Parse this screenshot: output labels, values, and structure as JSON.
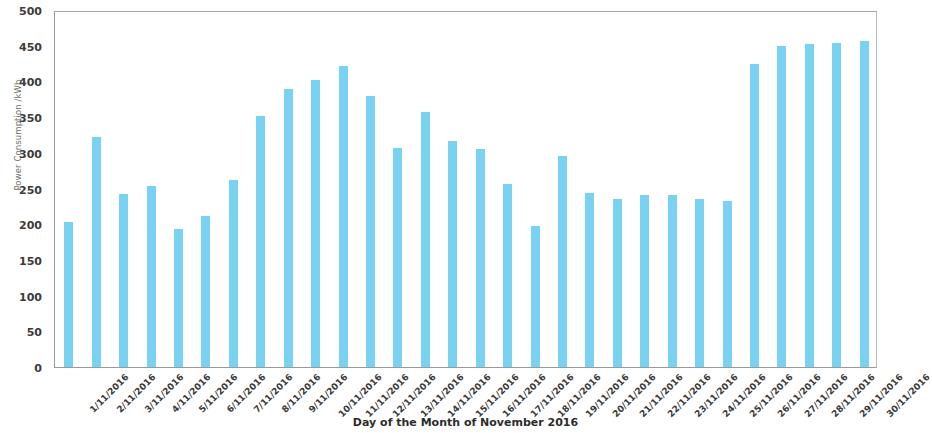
{
  "chart_data": {
    "type": "bar",
    "title": "",
    "xlabel": "Day of the Month of November 2016",
    "ylabel": "Power Consumption /kWh",
    "ylim": [
      0,
      500
    ],
    "ytick_step": 50,
    "yticks": [
      0,
      50,
      100,
      150,
      200,
      250,
      300,
      350,
      400,
      450,
      500
    ],
    "grid": false,
    "legend": "none",
    "bar_color": "#79d2f2",
    "frame_color": "#9a9a9a",
    "categories": [
      "1/11/2016",
      "2/11/2016",
      "3/11/2016",
      "4/11/2016",
      "5/11/2016",
      "6/11/2016",
      "7/11/2016",
      "8/11/2016",
      "9/11/2016",
      "10/11/2016",
      "11/11/2016",
      "12/11/2016",
      "13/11/2016",
      "14/11/2016",
      "15/11/2016",
      "16/11/2016",
      "17/11/2016",
      "18/11/2016",
      "19/11/2016",
      "20/11/2016",
      "21/11/2016",
      "22/11/2016",
      "23/11/2016",
      "24/11/2016",
      "25/11/2016",
      "26/11/2016",
      "27/11/2016",
      "28/11/2016",
      "29/11/2016",
      "30/11/2016"
    ],
    "values": [
      203,
      322,
      243,
      254,
      193,
      211,
      262,
      352,
      389,
      402,
      421,
      380,
      307,
      357,
      317,
      305,
      257,
      197,
      295,
      244,
      236,
      241,
      241,
      236,
      232,
      425,
      450,
      453,
      454,
      456
    ]
  }
}
